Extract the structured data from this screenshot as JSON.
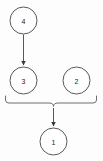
{
  "diagram": {
    "type": "flow-graph",
    "canvas": {
      "width": 103,
      "height": 161,
      "background": "#fdfdfd"
    },
    "style": {
      "node_stroke": "#58585a",
      "node_fill": "#ffffff",
      "edge_color": "#58585a",
      "brace_color": "#6e6e70",
      "label_color": "#1a1a1a"
    },
    "nodes": [
      {
        "id": "n4",
        "label": "4",
        "cx": 23.5,
        "cy": 20.5,
        "r": 13.5
      },
      {
        "id": "n3",
        "label": "3",
        "cx": 23.5,
        "cy": 80.5,
        "r": 13.5
      },
      {
        "id": "n2",
        "label": "2",
        "cx": 76.5,
        "cy": 80.5,
        "r": 13.5
      },
      {
        "id": "n1",
        "label": "1",
        "cx": 53.5,
        "cy": 141.5,
        "r": 13.5
      }
    ],
    "edges": [
      {
        "id": "e43",
        "from": "4",
        "to": "3",
        "x": 23.5,
        "y1": 34.5,
        "y2": 66
      },
      {
        "id": "ebrace1",
        "from": "group",
        "to": "1",
        "x": 53.5,
        "y1": 110,
        "y2": 127
      }
    ],
    "brace": {
      "id": "group-brace",
      "members": [
        "3",
        "2"
      ],
      "left": 5,
      "right": 97,
      "top": 96,
      "tip_x": 53.5,
      "tip_y": 110
    }
  }
}
